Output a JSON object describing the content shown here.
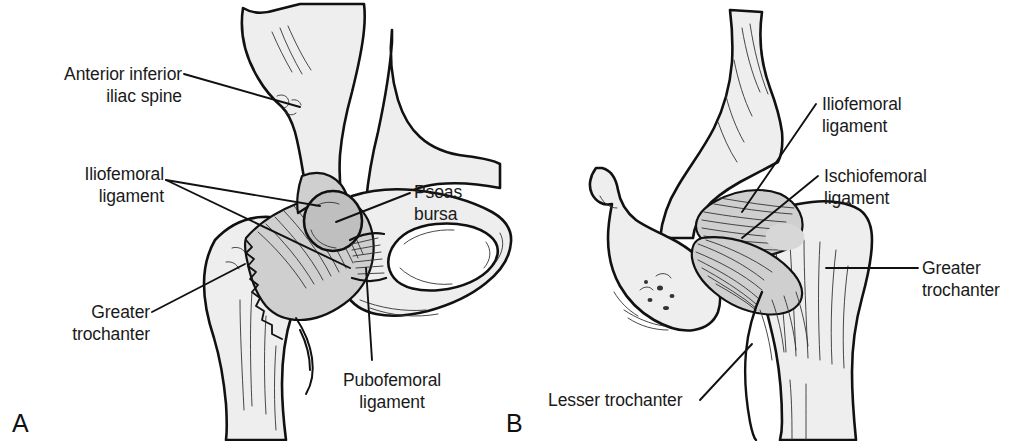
{
  "figure": {
    "background_color": "#ffffff",
    "text_color": "#1a1a1a",
    "bone_fill_color": "#eeeeee",
    "ligament_fill_color": "#cfcfcf",
    "line_color": "#111111"
  },
  "panels": [
    {
      "letter": "A",
      "view": "anterior",
      "labels": [
        {
          "id": "anterior-inferior-iliac-spine",
          "lines": [
            "Anterior inferior",
            "iliac spine"
          ],
          "line1": "Anterior inferior",
          "line2": "iliac spine",
          "align": "right",
          "leader_count": 1
        },
        {
          "id": "iliofemoral-ligament-a",
          "lines": [
            "Iliofemoral",
            "ligament"
          ],
          "line1": "Iliofemoral",
          "line2": "ligament",
          "align": "right",
          "leader_count": 2
        },
        {
          "id": "psoas-bursa",
          "lines": [
            "Psoas",
            "bursa"
          ],
          "line1": "Psoas",
          "line2": "bursa",
          "align": "left",
          "leader_count": 1
        },
        {
          "id": "greater-trochanter-a",
          "lines": [
            "Greater",
            "trochanter"
          ],
          "line1": "Greater",
          "line2": "trochanter",
          "align": "right",
          "leader_count": 1
        },
        {
          "id": "pubofemoral-ligament",
          "lines": [
            "Pubofemoral",
            "ligament"
          ],
          "line1": "Pubofemoral",
          "line2": "ligament",
          "align": "center",
          "leader_count": 1
        }
      ]
    },
    {
      "letter": "B",
      "view": "posterior",
      "labels": [
        {
          "id": "iliofemoral-ligament-b",
          "lines": [
            "Iliofemoral",
            "ligament"
          ],
          "line1": "Iliofemoral",
          "line2": "ligament",
          "align": "left",
          "leader_count": 1
        },
        {
          "id": "ischiofemoral-ligament",
          "lines": [
            "Ischiofemoral",
            "ligament"
          ],
          "line1": "Ischiofemoral",
          "line2": "ligament",
          "align": "left",
          "leader_count": 1
        },
        {
          "id": "greater-trochanter-b",
          "lines": [
            "Greater",
            "trochanter"
          ],
          "line1": "Greater",
          "line2": "trochanter",
          "align": "left",
          "leader_count": 1
        },
        {
          "id": "lesser-trochanter",
          "lines": [
            "Lesser trochanter"
          ],
          "line1": "Lesser trochanter",
          "line2": "",
          "align": "left",
          "leader_count": 1
        }
      ]
    }
  ]
}
